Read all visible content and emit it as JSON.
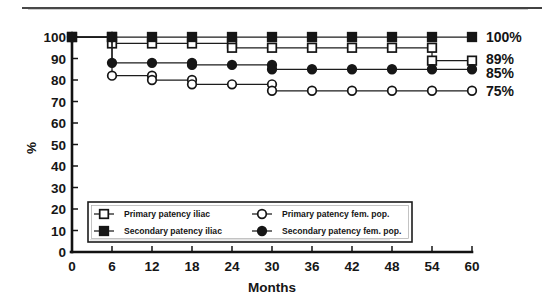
{
  "chart_data": {
    "type": "line",
    "title": "",
    "xlabel": "Months",
    "ylabel": "%",
    "xlim": [
      0,
      60
    ],
    "ylim": [
      0,
      100
    ],
    "x": [
      0,
      6,
      12,
      18,
      24,
      30,
      36,
      42,
      48,
      54,
      60
    ],
    "xticks": [
      "0",
      "6",
      "12",
      "18",
      "24",
      "30",
      "36",
      "42",
      "48",
      "54",
      "60"
    ],
    "yticks": [
      "0",
      "10",
      "20",
      "30",
      "40",
      "50",
      "60",
      "70",
      "80",
      "90",
      "100"
    ],
    "grid": false,
    "legend_position": "inside-bottom-left",
    "series": [
      {
        "name": "Primary patency iliac",
        "marker": "open-square",
        "values": [
          100,
          97,
          97,
          97,
          95,
          95,
          95,
          95,
          95,
          89,
          89
        ]
      },
      {
        "name": "Secondary patency iliac",
        "marker": "filled-square",
        "values": [
          100,
          100,
          100,
          100,
          100,
          100,
          100,
          100,
          100,
          100,
          100
        ]
      },
      {
        "name": "Primary patency fem. pop.",
        "marker": "open-circle",
        "values": [
          100,
          82,
          80,
          78,
          78,
          75,
          75,
          75,
          75,
          75,
          75
        ]
      },
      {
        "name": "Secondary patency fem. pop.",
        "marker": "filled-circle",
        "values": [
          100,
          88,
          88,
          87,
          87,
          85,
          85,
          85,
          85,
          85,
          85
        ]
      }
    ],
    "end_labels": [
      {
        "text": "100%",
        "value": 100
      },
      {
        "text": "89%",
        "value": 89
      },
      {
        "text": "85%",
        "value": 85
      },
      {
        "text": "75%",
        "value": 75
      }
    ],
    "legend": [
      {
        "label": "Primary patency iliac",
        "marker": "open-square"
      },
      {
        "label": "Primary patency fem. pop.",
        "marker": "open-circle"
      },
      {
        "label": "Secondary patency iliac",
        "marker": "filled-square"
      },
      {
        "label": "Secondary patency fem. pop.",
        "marker": "filled-circle"
      }
    ]
  }
}
